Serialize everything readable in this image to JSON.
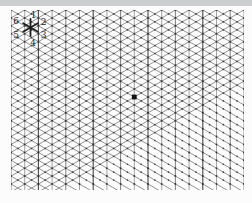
{
  "figure": {
    "background_color": "#fcfcfc",
    "top_band": {
      "color": "#cbcfd0",
      "height": 6
    },
    "grid": {
      "left": 11,
      "top": 10,
      "right": 243.9,
      "bottom": 190,
      "column_spacing": 13.7,
      "row_spacing": 7.91,
      "diagonal_slope": 0.57735,
      "diagonal_color": "#454545",
      "vertical_colors": [
        "#6f6f6f",
        "#9b9b9b",
        "#4a4a4a",
        "#9b9b9b"
      ],
      "node_dot_color": "#2a2a2a"
    },
    "direction_rose": {
      "center_x": 30.5,
      "center_y": 27.5,
      "ray_length": 8.5,
      "ray_color": "#1d1d1d",
      "labels": [
        {
          "text": "1",
          "x": 33.5,
          "y": 15
        },
        {
          "text": "2",
          "x": 43.5,
          "y": 21.5
        },
        {
          "text": "3",
          "x": 43.5,
          "y": 35
        },
        {
          "text": "4",
          "x": 33,
          "y": 43
        },
        {
          "text": "5",
          "x": 16,
          "y": 35
        },
        {
          "text": "6",
          "x": 16,
          "y": 20.5
        }
      ]
    },
    "marker": {
      "x": 134.3,
      "y": 97,
      "size": 4.8,
      "color": "#111111"
    }
  }
}
